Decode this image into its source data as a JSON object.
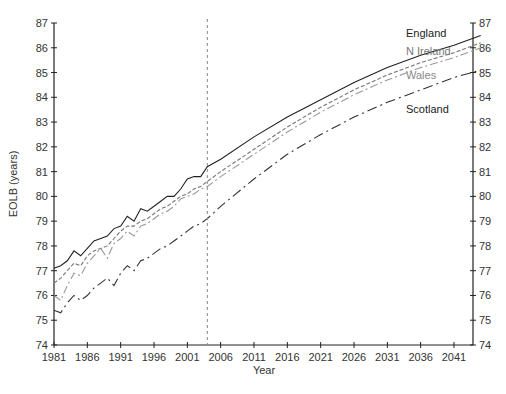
{
  "chart_data": {
    "type": "line",
    "title": "",
    "xlabel": "Year",
    "ylabel": "EOLB (years)",
    "xlim": [
      1981,
      2045
    ],
    "ylim": [
      74,
      87
    ],
    "x_ticks": [
      1981,
      1986,
      1991,
      1996,
      2001,
      2006,
      2011,
      2016,
      2021,
      2026,
      2031,
      2036,
      2041
    ],
    "y_ticks": [
      74,
      75,
      76,
      77,
      78,
      79,
      80,
      81,
      82,
      83,
      84,
      85,
      86,
      87
    ],
    "y_axis_right_mirrored": true,
    "grid": false,
    "vertical_reference_line": {
      "x": 2004,
      "style": "dashed"
    },
    "legend": "inline labels at right",
    "series": [
      {
        "name": "England",
        "style": "solid",
        "color": "#222222",
        "x": [
          1981,
          1982,
          1983,
          1984,
          1985,
          1986,
          1987,
          1988,
          1989,
          1990,
          1991,
          1992,
          1993,
          1994,
          1995,
          1996,
          1997,
          1998,
          1999,
          2000,
          2001,
          2002,
          2003,
          2004,
          2006,
          2011,
          2016,
          2021,
          2026,
          2031,
          2036,
          2041,
          2045
        ],
        "values": [
          77.1,
          77.2,
          77.4,
          77.8,
          77.6,
          77.9,
          78.2,
          78.3,
          78.4,
          78.7,
          78.8,
          79.2,
          79.0,
          79.5,
          79.4,
          79.6,
          79.8,
          80.0,
          80.0,
          80.3,
          80.7,
          80.8,
          80.8,
          81.2,
          81.5,
          82.4,
          83.2,
          83.9,
          84.6,
          85.2,
          85.7,
          86.1,
          86.5
        ]
      },
      {
        "name": "N Ireland",
        "style": "dashed",
        "color": "#777777",
        "x": [
          1981,
          1982,
          1983,
          1984,
          1985,
          1986,
          1987,
          1988,
          1989,
          1990,
          1991,
          1992,
          1993,
          1994,
          1995,
          1996,
          1997,
          1998,
          1999,
          2000,
          2001,
          2002,
          2003,
          2004,
          2006,
          2011,
          2016,
          2021,
          2026,
          2031,
          2036,
          2041,
          2045
        ],
        "values": [
          76.5,
          76.7,
          77.0,
          77.3,
          77.2,
          77.6,
          77.8,
          77.9,
          78.0,
          78.3,
          78.6,
          78.8,
          78.8,
          79.0,
          79.1,
          79.3,
          79.5,
          79.6,
          79.8,
          80.0,
          80.1,
          80.3,
          80.4,
          80.6,
          81.0,
          81.9,
          82.8,
          83.6,
          84.3,
          84.9,
          85.4,
          85.8,
          86.2
        ]
      },
      {
        "name": "Wales",
        "style": "dash-dot",
        "color": "#999999",
        "x": [
          1981,
          1982,
          1983,
          1984,
          1985,
          1986,
          1987,
          1988,
          1989,
          1990,
          1991,
          1992,
          1993,
          1994,
          1995,
          1996,
          1997,
          1998,
          1999,
          2000,
          2001,
          2002,
          2003,
          2004,
          2006,
          2011,
          2016,
          2021,
          2026,
          2031,
          2036,
          2041,
          2045
        ],
        "values": [
          76.0,
          75.8,
          76.4,
          76.9,
          76.8,
          77.3,
          77.6,
          77.9,
          77.5,
          78.1,
          78.3,
          78.6,
          78.4,
          78.8,
          78.9,
          79.1,
          79.3,
          79.4,
          79.6,
          79.9,
          80.0,
          80.1,
          80.3,
          80.4,
          80.8,
          81.7,
          82.6,
          83.4,
          84.1,
          84.7,
          85.2,
          85.6,
          86.0
        ]
      },
      {
        "name": "Scotland",
        "style": "long-dash-dot",
        "color": "#333333",
        "x": [
          1981,
          1982,
          1983,
          1984,
          1985,
          1986,
          1987,
          1988,
          1989,
          1990,
          1991,
          1992,
          1993,
          1994,
          1995,
          1996,
          1997,
          1998,
          1999,
          2000,
          2001,
          2002,
          2003,
          2004,
          2006,
          2011,
          2016,
          2021,
          2026,
          2031,
          2036,
          2041,
          2045
        ],
        "values": [
          75.4,
          75.3,
          75.7,
          76.0,
          75.8,
          76.0,
          76.3,
          76.5,
          76.7,
          76.4,
          76.9,
          77.2,
          77.0,
          77.4,
          77.5,
          77.7,
          77.9,
          78.0,
          78.2,
          78.4,
          78.6,
          78.8,
          78.9,
          79.1,
          79.6,
          80.7,
          81.7,
          82.5,
          83.2,
          83.8,
          84.3,
          84.8,
          85.1
        ]
      }
    ],
    "annotations": [
      {
        "text": "England",
        "x": 2035.5,
        "y": 86.5
      },
      {
        "text": "N Ireland",
        "x": 2035.5,
        "y": 85.9
      },
      {
        "text": "Wales",
        "x": 2035.5,
        "y": 84.9
      },
      {
        "text": "Scotland",
        "x": 2035.5,
        "y": 83.6
      }
    ]
  },
  "labels": {
    "xlabel": "Year",
    "ylabel": "EOLB (years)",
    "england": "England",
    "nireland": "N Ireland",
    "wales": "Wales",
    "scotland": "Scotland"
  }
}
